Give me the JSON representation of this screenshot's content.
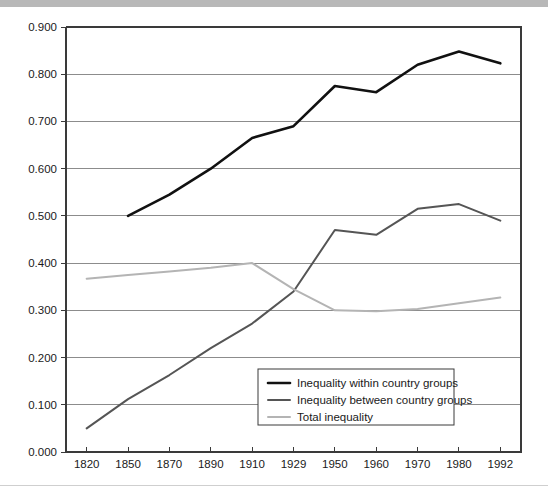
{
  "chart_data": {
    "type": "line",
    "title": "",
    "xlabel": "",
    "ylabel": "",
    "categories": [
      "1820",
      "1850",
      "1870",
      "1890",
      "1910",
      "1929",
      "1950",
      "1960",
      "1970",
      "1980",
      "1992"
    ],
    "ylim": [
      0.0,
      0.9
    ],
    "ytick_labels": [
      "0.000",
      "0.100",
      "0.200",
      "0.300",
      "0.400",
      "0.500",
      "0.600",
      "0.700",
      "0.800",
      "0.900"
    ],
    "ytick_values": [
      0.0,
      0.1,
      0.2,
      0.3,
      0.4,
      0.5,
      0.6,
      0.7,
      0.8,
      0.9
    ],
    "grid": true,
    "grid_axis": "y",
    "legend_position": "inside-bottom-center",
    "series": [
      {
        "name": "Inequality within country groups",
        "color": "#111111",
        "width": 2.6,
        "x": [
          "1850",
          "1870",
          "1890",
          "1910",
          "1929",
          "1950",
          "1960",
          "1970",
          "1980",
          "1992"
        ],
        "values": [
          0.5,
          0.545,
          0.6,
          0.665,
          0.69,
          0.775,
          0.762,
          0.82,
          0.848,
          0.823
        ]
      },
      {
        "name": "Inequality between country groups",
        "color": "#555555",
        "width": 2.0,
        "x": [
          "1820",
          "1850",
          "1870",
          "1890",
          "1910",
          "1929",
          "1950",
          "1960",
          "1970",
          "1980",
          "1992"
        ],
        "values": [
          0.05,
          0.112,
          0.163,
          0.22,
          0.272,
          0.34,
          0.47,
          0.46,
          0.515,
          0.525,
          0.49
        ]
      },
      {
        "name": "Total inequality",
        "color": "#b4b4b4",
        "width": 2.0,
        "x": [
          "1820",
          "1850",
          "1870",
          "1890",
          "1910",
          "1929",
          "1950",
          "1960",
          "1970",
          "1980",
          "1992"
        ],
        "values": [
          0.367,
          0.375,
          0.382,
          0.39,
          0.4,
          0.345,
          0.3,
          0.298,
          0.303,
          0.315,
          0.327
        ]
      }
    ]
  },
  "legend": {
    "entries": [
      {
        "label": "Inequality within country groups"
      },
      {
        "label": "Inequality between country groups"
      },
      {
        "label": "Total inequality"
      }
    ]
  }
}
